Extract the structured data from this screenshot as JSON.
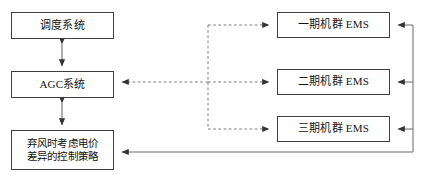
{
  "diagram": {
    "width": 425,
    "height": 175,
    "background_color": "#ffffff",
    "solid_line_color": "#4a4a4a",
    "dashed_line_color": "#6b6b6b",
    "box_border_color": "#3f3f3f",
    "text_color": "#141414",
    "nodes": {
      "dispatch": {
        "label": "调度系统"
      },
      "agc": {
        "label": "AGC系统"
      },
      "strategy": {
        "label": "弃风时考虑电价\n差异的控制策略"
      },
      "ems_phase_1": {
        "label": "一期机群 EMS"
      },
      "ems_phase_2": {
        "label": "二期机群 EMS"
      },
      "ems_phase_3": {
        "label": "三期机群 EMS"
      }
    },
    "connectors": [
      {
        "name": "dispatch-agc",
        "from": "dispatch",
        "to": "agc",
        "style": "solid",
        "arrows": "both"
      },
      {
        "name": "agc-strategy",
        "from": "agc",
        "to": "strategy",
        "style": "solid",
        "arrows": "both"
      },
      {
        "name": "bus-to-ems-1",
        "from": "dashed-bus",
        "to": "ems_phase_1",
        "style": "dashed",
        "arrows": "end"
      },
      {
        "name": "bus-to-ems-2",
        "from": "dashed-bus",
        "to": "ems_phase_2",
        "style": "dashed",
        "arrows": "end"
      },
      {
        "name": "bus-to-ems-3",
        "from": "dashed-bus",
        "to": "ems_phase_3",
        "style": "dashed",
        "arrows": "end"
      },
      {
        "name": "bus-to-agc",
        "from": "dashed-bus",
        "to": "agc",
        "style": "dashed",
        "arrows": "end"
      },
      {
        "name": "return-bus-to-ems-1",
        "from": "return-bus",
        "to": "ems_phase_1",
        "style": "solid",
        "arrows": "end"
      },
      {
        "name": "return-bus-to-ems-2",
        "from": "return-bus",
        "to": "ems_phase_2",
        "style": "solid",
        "arrows": "end"
      },
      {
        "name": "return-bus-to-ems-3",
        "from": "return-bus",
        "to": "ems_phase_3",
        "style": "solid",
        "arrows": "end"
      },
      {
        "name": "return-bus-to-strategy",
        "from": "return-bus",
        "to": "strategy",
        "style": "solid",
        "arrows": "end"
      }
    ]
  }
}
